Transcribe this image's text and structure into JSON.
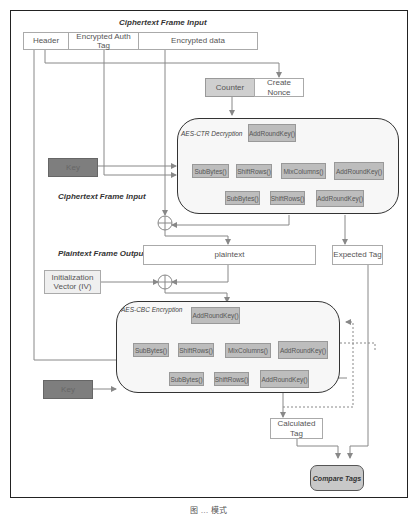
{
  "labels": {
    "ciphertext_frame_input_top": "Ciphertext Frame Input",
    "ciphertext_frame_input_mid": "Ciphertext Frame Input",
    "plaintext_frame_output": "Plaintext Frame Output"
  },
  "frame_fields": {
    "header": "Header",
    "auth_tag": "Encrypted Auth Tag",
    "encrypted_data": "Encrypted data"
  },
  "nonce": {
    "counter": "Counter",
    "create_nonce": "Create Nonce"
  },
  "ctr_block": {
    "title": "AES-CTR Decryption",
    "initial_add_round_key": "AddRoundKey()",
    "round_row": [
      "SubBytes()",
      "ShiftRows()",
      "MixColumns()",
      "AddRoundKey()"
    ],
    "final_row": [
      "SubBytes()",
      "ShiftRows()",
      "AddRoundKey()"
    ]
  },
  "cbc_block": {
    "title": "AES-CBC Encryption",
    "initial_add_round_key": "AddRoundKey()",
    "round_row": [
      "SubBytes()",
      "ShiftRows()",
      "MixColumns()",
      "AddRoundKey()"
    ],
    "final_row": [
      "SubBytes()",
      "ShiftRows()",
      "AddRoundKey()"
    ]
  },
  "key_top": "Key",
  "key_bottom": "Key",
  "plaintext": "plaintext",
  "expected_tag": "Expected Tag",
  "iv": "Initialization Vector (IV)",
  "calculated_tag": "Calculated Tag",
  "compare_tags": "Compare Tags",
  "caption": "图 … 模式",
  "colors": {
    "gray_box": "#bdbdbd",
    "key_box": "#7e7e7e",
    "line": "#888888",
    "frame": "#222222"
  }
}
